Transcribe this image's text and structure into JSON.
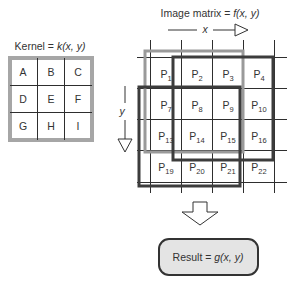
{
  "kernel": {
    "title_prefix": "Kernel = ",
    "title_func": "k(x, y)",
    "cells": [
      "A",
      "B",
      "C",
      "D",
      "E",
      "F",
      "G",
      "H",
      "I"
    ]
  },
  "image_matrix": {
    "title_prefix": "Image matrix = ",
    "title_func": "f(x, y)",
    "x_axis_label": "x",
    "y_axis_label": "y",
    "cell_prefix": "P",
    "rows": [
      [
        "1",
        "2",
        "3",
        "4"
      ],
      [
        "7",
        "8",
        "9",
        "10"
      ],
      [
        "13",
        "14",
        "15",
        "16"
      ],
      [
        "19",
        "20",
        "21",
        "22"
      ]
    ]
  },
  "result": {
    "label_prefix": "Result = ",
    "label_func": "g(x, y)"
  },
  "colors": {
    "kernel_border": "#a6a6a6",
    "window_light": "#9a9a9a",
    "window_dark": "#3c3c3c",
    "grid": "#2e2e2e",
    "result_fill": "#e4e4e4"
  }
}
